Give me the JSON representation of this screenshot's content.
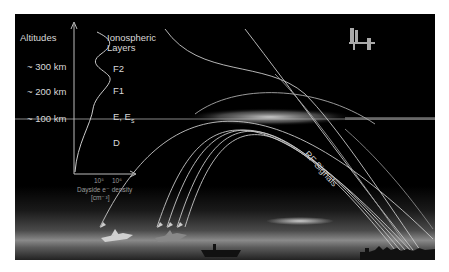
{
  "diagram": {
    "axis_title_left": "Altitudes",
    "axis_title_right_line1": "Ionospheric",
    "axis_title_right_line2": "Layers",
    "altitudes": [
      {
        "label": "~ 300 km",
        "layer": "F2"
      },
      {
        "label": "~ 200 km",
        "layer": "F1"
      },
      {
        "label": "~ 100 km",
        "layer": "E, E",
        "layer_sub": "s"
      },
      {
        "label": "",
        "layer": "D"
      }
    ],
    "density_axis": {
      "ticks": [
        "10⁵",
        "10⁶"
      ],
      "label_line1": "Dayside e⁻ density",
      "label_line2": "[cm⁻³]"
    },
    "signals_label": "RF Signals",
    "icons": {
      "satellite": "space-station-icon",
      "aircraft": [
        "jet-aircraft-icon",
        "fighter-aircraft-icon"
      ],
      "ship": "aircraft-carrier-icon",
      "city": "city-skyline-icon"
    },
    "colors": {
      "background": "#000000",
      "text": "#d8d8d8",
      "curve": "#cccccc",
      "border": "#ffffff"
    }
  }
}
